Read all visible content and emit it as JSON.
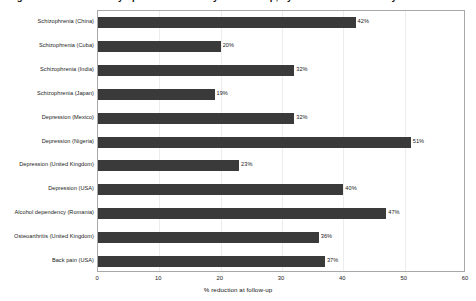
{
  "chart_data": {
    "type": "bar",
    "orientation": "horizontal",
    "title": "Figure 1. Reduction in symptoms or disability at follow-up, by condition and country",
    "xlabel": "% reduction at follow-up",
    "ylabel": "",
    "xlim": [
      0,
      60
    ],
    "xticks": [
      0,
      10,
      20,
      30,
      40,
      50,
      60
    ],
    "xtick_labels": [
      "0",
      "10",
      "20",
      "30",
      "40",
      "50",
      "60"
    ],
    "grid": "vertical",
    "legend": "none",
    "bar_color": "#3a3a3a",
    "categories": [
      "Schizophrenia (China)",
      "Schizophrenia (Cuba)",
      "Schizophrenia (India)",
      "Schizophrenia (Japan)",
      "Depression (Mexico)",
      "Depression (Nigeria)",
      "Depression (United Kingdom)",
      "Depression (USA)",
      "Alcohol dependency (Romania)",
      "Osteoarthritis (United Kingdom)",
      "Back pain (USA)"
    ],
    "values": [
      42,
      20,
      32,
      19,
      32,
      51,
      23,
      40,
      47,
      36,
      37
    ],
    "value_labels": [
      "42%",
      "20%",
      "32%",
      "19%",
      "32%",
      "51%",
      "23%",
      "40%",
      "47%",
      "36%",
      "37%"
    ]
  }
}
